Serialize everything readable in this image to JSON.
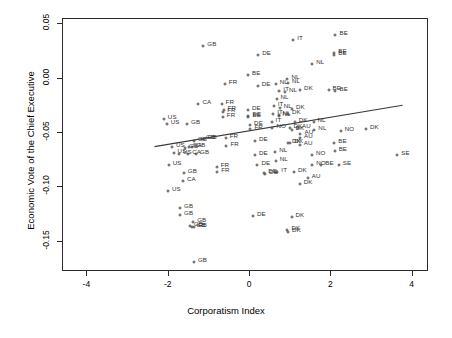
{
  "chart_data": {
    "type": "scatter",
    "title": "",
    "xlabel": "Corporatism Index",
    "ylabel": "Economic Vote of the Chief Executive",
    "xlim": [
      -4.6,
      4.4
    ],
    "ylim": [
      -0.178,
      0.055
    ],
    "xticks": [
      -4,
      -2,
      0,
      2,
      4
    ],
    "xticklabels": [
      "-4",
      "-2",
      "0",
      "2",
      "4"
    ],
    "yticks": [
      0.05,
      0.0,
      -0.05,
      -0.1,
      -0.15
    ],
    "yticklabels": [
      "0.05",
      "0.00",
      "-0.05",
      "-0.10",
      "-0.15"
    ],
    "grid": false,
    "legend": false,
    "point_marker": "plus",
    "point_label_field": "country",
    "marker_color": "#4a4a4a",
    "label_color": "#2f2f2f",
    "fit_line": {
      "type": "linear-regression",
      "color": "#3a3a3a",
      "x_start": -2.35,
      "y_start": -0.0625,
      "x_end": 3.75,
      "y_end": -0.0245
    },
    "points": [
      {
        "country": "GB",
        "x": -1.15,
        "y": 0.0305
      },
      {
        "country": "DE",
        "x": 0.2,
        "y": 0.0215
      },
      {
        "country": "IT",
        "x": 1.06,
        "y": 0.0355
      },
      {
        "country": "BE",
        "x": 2.1,
        "y": 0.0405
      },
      {
        "country": "NL",
        "x": 1.53,
        "y": 0.0135
      },
      {
        "country": "NL",
        "x": 0.92,
        "y": 0.0
      },
      {
        "country": "NL",
        "x": 0.93,
        "y": -0.004
      },
      {
        "country": "BE",
        "x": 2.07,
        "y": 0.022
      },
      {
        "country": "BE",
        "x": 2.07,
        "y": 0.0235
      },
      {
        "country": "FR",
        "x": -0.62,
        "y": -0.0045
      },
      {
        "country": "DE",
        "x": 0.19,
        "y": -0.007
      },
      {
        "country": "BE",
        "x": -0.05,
        "y": 0.003
      },
      {
        "country": "NL",
        "x": 0.63,
        "y": -0.0045
      },
      {
        "country": "IT",
        "x": 0.72,
        "y": -0.0115
      },
      {
        "country": "NL",
        "x": 0.86,
        "y": -0.012
      },
      {
        "country": "DK",
        "x": 1.23,
        "y": -0.0105
      },
      {
        "country": "BE",
        "x": 1.93,
        "y": -0.01
      },
      {
        "country": "BE",
        "x": 2.1,
        "y": -0.011
      },
      {
        "country": "NL",
        "x": 0.65,
        "y": -0.0185
      },
      {
        "country": "CA",
        "x": -1.27,
        "y": -0.0235
      },
      {
        "country": "FR",
        "x": -0.7,
        "y": -0.0235
      },
      {
        "country": "FR",
        "x": -0.65,
        "y": -0.029
      },
      {
        "country": "FR",
        "x": -0.66,
        "y": -0.0305
      },
      {
        "country": "FR",
        "x": -0.67,
        "y": -0.035
      },
      {
        "country": "DE",
        "x": -0.05,
        "y": -0.0285
      },
      {
        "country": "DE",
        "x": -0.04,
        "y": -0.034
      },
      {
        "country": "BE",
        "x": -0.04,
        "y": -0.0355
      },
      {
        "country": "IT",
        "x": 0.58,
        "y": -0.0255
      },
      {
        "country": "NL",
        "x": 0.73,
        "y": -0.027
      },
      {
        "country": "IT",
        "x": 0.57,
        "y": -0.0325
      },
      {
        "country": "NL",
        "x": 0.7,
        "y": -0.033
      },
      {
        "country": "NL",
        "x": 0.7,
        "y": -0.034
      },
      {
        "country": "DK",
        "x": 0.93,
        "y": -0.0325
      },
      {
        "country": "DK",
        "x": 1.03,
        "y": -0.0275
      },
      {
        "country": "US",
        "x": -2.12,
        "y": -0.0375
      },
      {
        "country": "US",
        "x": -2.05,
        "y": -0.0415
      },
      {
        "country": "GB",
        "x": -1.55,
        "y": -0.0415
      },
      {
        "country": "DE",
        "x": 0.0,
        "y": -0.043
      },
      {
        "country": "FR",
        "x": 0.01,
        "y": -0.046
      },
      {
        "country": "NL",
        "x": 1.56,
        "y": -0.04
      },
      {
        "country": "NL",
        "x": 1.58,
        "y": -0.047
      },
      {
        "country": "DK",
        "x": 1.1,
        "y": -0.04
      },
      {
        "country": "IT",
        "x": 0.53,
        "y": -0.0395
      },
      {
        "country": "NO",
        "x": 0.55,
        "y": -0.0455
      },
      {
        "country": "DK",
        "x": 0.97,
        "y": -0.0455
      },
      {
        "country": "DK",
        "x": 1.02,
        "y": -0.047
      },
      {
        "country": "AU",
        "x": 1.18,
        "y": -0.045
      },
      {
        "country": "GB",
        "x": -1.38,
        "y": -0.057
      },
      {
        "country": "GB",
        "x": -1.18,
        "y": -0.0555
      },
      {
        "country": "GB",
        "x": -1.14,
        "y": -0.0555
      },
      {
        "country": "FR",
        "x": -0.6,
        "y": -0.0545
      },
      {
        "country": "DE",
        "x": 0.12,
        "y": -0.0575
      },
      {
        "country": "AU",
        "x": 1.24,
        "y": -0.0505
      },
      {
        "country": "AU",
        "x": 1.23,
        "y": -0.0545
      },
      {
        "country": "NO",
        "x": 2.23,
        "y": -0.048
      },
      {
        "country": "DK",
        "x": 2.85,
        "y": -0.046
      },
      {
        "country": "US",
        "x": -1.92,
        "y": -0.0625
      },
      {
        "country": "GB",
        "x": -1.6,
        "y": -0.0635
      },
      {
        "country": "CA",
        "x": -1.5,
        "y": -0.063
      },
      {
        "country": "GB",
        "x": -1.42,
        "y": -0.063
      },
      {
        "country": "FR",
        "x": -0.58,
        "y": -0.062
      },
      {
        "country": "DK",
        "x": 0.93,
        "y": -0.059
      },
      {
        "country": "DK",
        "x": 0.99,
        "y": -0.0595
      },
      {
        "country": "AU",
        "x": 1.22,
        "y": -0.061
      },
      {
        "country": "BE",
        "x": 2.07,
        "y": -0.059
      },
      {
        "country": "US",
        "x": -1.88,
        "y": -0.0685
      },
      {
        "country": "US",
        "x": -1.75,
        "y": -0.069
      },
      {
        "country": "CA",
        "x": -1.52,
        "y": -0.069
      },
      {
        "country": "GB",
        "x": -1.33,
        "y": -0.069
      },
      {
        "country": "DE",
        "x": 0.12,
        "y": -0.0705
      },
      {
        "country": "NL",
        "x": 0.62,
        "y": -0.0675
      },
      {
        "country": "BE",
        "x": 2.08,
        "y": -0.067
      },
      {
        "country": "NO",
        "x": 1.52,
        "y": -0.0705
      },
      {
        "country": "SE",
        "x": 3.62,
        "y": -0.07
      },
      {
        "country": "US",
        "x": -2.0,
        "y": -0.079
      },
      {
        "country": "FR",
        "x": -0.82,
        "y": -0.081
      },
      {
        "country": "FR",
        "x": -0.81,
        "y": -0.0855
      },
      {
        "country": "DE",
        "x": 0.18,
        "y": -0.079
      },
      {
        "country": "NL",
        "x": 0.63,
        "y": -0.076
      },
      {
        "country": "IT",
        "x": 0.67,
        "y": -0.0855
      },
      {
        "country": "NO",
        "x": 1.53,
        "y": -0.079
      },
      {
        "country": "BE",
        "x": 1.75,
        "y": -0.079
      },
      {
        "country": "SE",
        "x": 2.18,
        "y": -0.079
      },
      {
        "country": "GB",
        "x": -1.63,
        "y": -0.087
      },
      {
        "country": "DE",
        "x": 0.35,
        "y": -0.087
      },
      {
        "country": "DE",
        "x": 0.37,
        "y": -0.088
      },
      {
        "country": "DK",
        "x": 1.08,
        "y": -0.086
      },
      {
        "country": "CA",
        "x": -1.65,
        "y": -0.0945
      },
      {
        "country": "AU",
        "x": 1.42,
        "y": -0.091
      },
      {
        "country": "DK",
        "x": 1.22,
        "y": -0.0965
      },
      {
        "country": "US",
        "x": -2.02,
        "y": -0.1035
      },
      {
        "country": "GB",
        "x": -1.72,
        "y": -0.1195
      },
      {
        "country": "GB",
        "x": -1.72,
        "y": -0.1255
      },
      {
        "country": "DE",
        "x": 0.07,
        "y": -0.1265
      },
      {
        "country": "GB",
        "x": -1.4,
        "y": -0.132
      },
      {
        "country": "GB",
        "x": -1.48,
        "y": -0.1355
      },
      {
        "country": "GB",
        "x": -1.42,
        "y": -0.137
      },
      {
        "country": "GB",
        "x": -1.38,
        "y": -0.137
      },
      {
        "country": "DK",
        "x": 0.92,
        "y": -0.1395
      },
      {
        "country": "DK",
        "x": 0.93,
        "y": -0.1415
      },
      {
        "country": "DK",
        "x": 1.02,
        "y": -0.1275
      },
      {
        "country": "GB",
        "x": -1.38,
        "y": -0.169
      }
    ]
  }
}
